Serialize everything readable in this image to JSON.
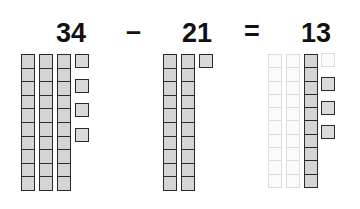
{
  "equation": {
    "minuend": "34",
    "operator_minus": "–",
    "subtrahend": "21",
    "operator_equals": "=",
    "difference": "13"
  },
  "blocks": {
    "minuend": {
      "tens": 3,
      "ones": 4
    },
    "subtrahend": {
      "tens": 2,
      "ones": 1
    },
    "difference": {
      "tens": 1,
      "ones": 3,
      "crossed_out_tens": 2,
      "crossed_out_ones": 1
    }
  },
  "colors": {
    "block_fill": "#d4d4d4",
    "block_outline": "#2a2a2a",
    "faded_outline": "#dcdcdc",
    "text": "#111111"
  }
}
